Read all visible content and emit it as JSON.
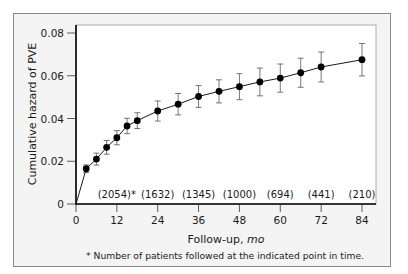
{
  "chart_data": {
    "type": "line",
    "title": "",
    "xlabel": "Follow-up, mo",
    "xlabel_main": "Follow-up, ",
    "xlabel_unit": "mo",
    "ylabel": "Cumulative hazard of PVE",
    "xlim": [
      0,
      88
    ],
    "ylim": [
      0,
      0.08
    ],
    "x_ticks": [
      0,
      12,
      24,
      36,
      48,
      60,
      72,
      84
    ],
    "y_ticks": [
      0,
      0.02,
      0.04,
      0.06,
      0.08
    ],
    "y_tick_labels": [
      "0",
      "0.02",
      "0.04",
      "0.06",
      "0.08"
    ],
    "grid": false,
    "legend": null,
    "series": [
      {
        "name": "Cumulative hazard of PVE",
        "starts_at_origin": true,
        "x": [
          3,
          6,
          9,
          12,
          15,
          18,
          24,
          30,
          36,
          42,
          48,
          54,
          60,
          66,
          72,
          84
        ],
        "values": [
          0.0165,
          0.021,
          0.0265,
          0.031,
          0.0365,
          0.039,
          0.0435,
          0.0467,
          0.0503,
          0.0527,
          0.0549,
          0.0571,
          0.0589,
          0.0614,
          0.0641,
          0.0675
        ],
        "err": [
          0.0018,
          0.0028,
          0.0032,
          0.0033,
          0.0036,
          0.0037,
          0.0047,
          0.005,
          0.0051,
          0.0054,
          0.0061,
          0.0065,
          0.0066,
          0.0068,
          0.007,
          0.0076
        ]
      }
    ],
    "annotations": {
      "patients_at_risk": [
        {
          "x": 12,
          "label": "(2054)*"
        },
        {
          "x": 24,
          "label": "(1632)"
        },
        {
          "x": 36,
          "label": "(1345)"
        },
        {
          "x": 48,
          "label": "(1000)"
        },
        {
          "x": 60,
          "label": "(694)"
        },
        {
          "x": 72,
          "label": "(441)"
        },
        {
          "x": 84,
          "label": "(210)"
        }
      ],
      "footnote": "* Number of patients followed at the indicated point in time."
    }
  },
  "colors": {
    "frame_bg": "#f4f4f4",
    "plot_bg": "#ffffff",
    "line": "#1a1a1a",
    "marker": "#000000",
    "error_bar": "#555555"
  }
}
